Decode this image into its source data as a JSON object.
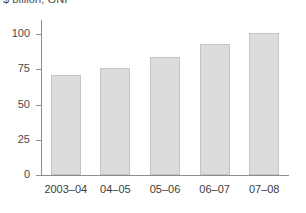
{
  "figure": {
    "unit_caption": "$ billion, GNI"
  },
  "chart_data": {
    "type": "bar",
    "title": "$ billion, GNI",
    "xlabel": "",
    "ylabel": "$ billion, GNI",
    "categories": [
      "2003–04",
      "04–05",
      "05–06",
      "06–07",
      "07–08"
    ],
    "values": [
      71,
      76,
      84,
      93,
      101
    ],
    "ylim": [
      0,
      112
    ],
    "yticks": [
      0,
      25,
      50,
      75,
      100
    ],
    "ytick_labels": [
      "0",
      "25",
      "50",
      "75",
      "100"
    ],
    "grid": false,
    "legend": null,
    "colors": {
      "bar_fill": "#dcdcdc",
      "bar_border": "#c3c3c3",
      "axis": "#8e8e8e",
      "text": "#3d3d3d",
      "background": "#ffffff"
    }
  }
}
